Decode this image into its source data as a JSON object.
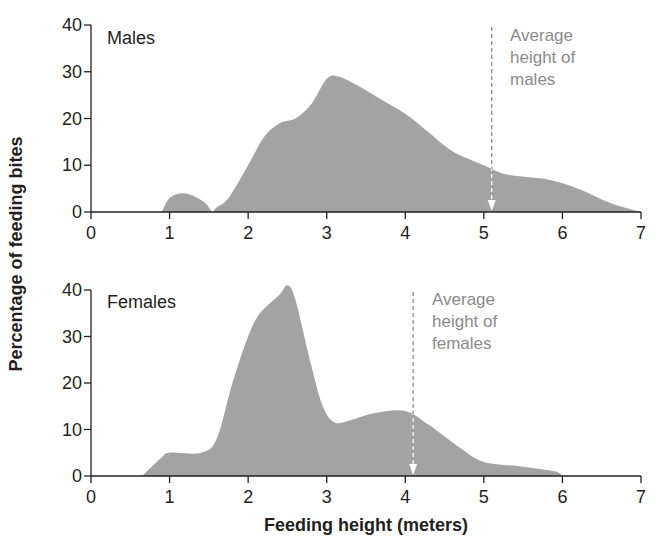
{
  "chart_data": [
    {
      "type": "area",
      "panel_label": "Males",
      "xlabel": "Feeding height (meters)",
      "ylabel": "Percentage of feeding bites",
      "xlim": [
        0,
        7
      ],
      "ylim": [
        0,
        40
      ],
      "x_ticks": [
        "0",
        "1",
        "2",
        "3",
        "4",
        "5",
        "6",
        "7"
      ],
      "y_ticks": [
        "0",
        "10",
        "20",
        "30",
        "40"
      ],
      "grid": false,
      "fill_color": "#a3a3a3",
      "series": [
        {
          "name": "Males",
          "x": [
            0.9,
            1.0,
            1.15,
            1.3,
            1.45,
            1.52,
            1.55,
            1.6,
            1.75,
            2.0,
            2.2,
            2.4,
            2.6,
            2.8,
            3.0,
            3.15,
            3.4,
            3.7,
            4.0,
            4.3,
            4.6,
            5.0,
            5.3,
            5.8,
            6.2,
            6.6,
            7.0
          ],
          "y": [
            0,
            3,
            4,
            3.5,
            2,
            0.5,
            0,
            1,
            3,
            10,
            16,
            19,
            20,
            23,
            28.5,
            29,
            27,
            24,
            21,
            17,
            13,
            10,
            8,
            7,
            5,
            2,
            0
          ]
        }
      ],
      "annotation": {
        "lines": [
          "Average",
          "height of",
          "males"
        ],
        "x": 5.1
      }
    },
    {
      "type": "area",
      "panel_label": "Females",
      "xlabel": "Feeding height (meters)",
      "ylabel": "Percentage of feeding bites",
      "xlim": [
        0,
        7
      ],
      "ylim": [
        0,
        40
      ],
      "x_ticks": [
        "0",
        "1",
        "2",
        "3",
        "4",
        "5",
        "6",
        "7"
      ],
      "y_ticks": [
        "0",
        "10",
        "20",
        "30",
        "40"
      ],
      "grid": false,
      "fill_color": "#a3a3a3",
      "series": [
        {
          "name": "Females",
          "x": [
            0.65,
            0.9,
            1.0,
            1.4,
            1.6,
            1.8,
            2.0,
            2.15,
            2.4,
            2.5,
            2.6,
            2.8,
            2.95,
            3.1,
            3.3,
            3.6,
            4.0,
            4.3,
            4.7,
            5.0,
            5.5,
            5.9,
            6.0
          ],
          "y": [
            0,
            4,
            5,
            5,
            8,
            20,
            30,
            35,
            39,
            41,
            38,
            24,
            15,
            11.5,
            12,
            13.5,
            14,
            11,
            6,
            3,
            2,
            1,
            0
          ]
        }
      ],
      "annotation": {
        "lines": [
          "Average",
          "height of",
          "females"
        ],
        "x": 4.1
      }
    }
  ],
  "labels": {
    "males": "Males",
    "females": "Females",
    "male_annot": [
      "Average",
      "height of",
      "males"
    ],
    "female_annot": [
      "Average",
      "height of",
      "females"
    ],
    "ylabel": "Percentage of feeding bites",
    "xlabel": "Feeding height (meters)"
  }
}
